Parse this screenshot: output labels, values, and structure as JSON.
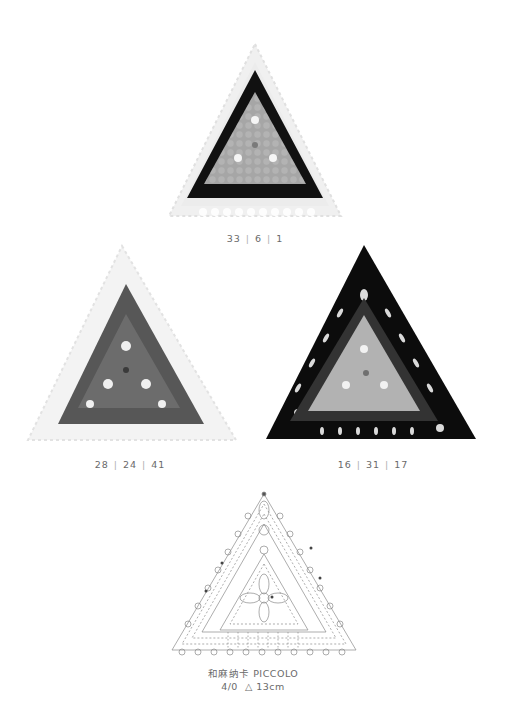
{
  "motifs": [
    {
      "id": "top",
      "caption_parts": [
        "33",
        "6",
        "1"
      ],
      "colors": {
        "outer": "#f2f2f2",
        "middle": "#111111",
        "inner": "#a8a8a8"
      }
    },
    {
      "id": "left",
      "caption_parts": [
        "28",
        "24",
        "41"
      ],
      "colors": {
        "outer": "#eeeeee",
        "middle": "#555555",
        "inner": "#6a6a6a"
      }
    },
    {
      "id": "right",
      "caption_parts": [
        "16",
        "31",
        "17"
      ],
      "colors": {
        "outer": "#0c0c0c",
        "middle": "#3a3a3a",
        "inner": "#b4b4b4"
      }
    }
  ],
  "diagram": {
    "yarn_line": "和麻纳卡 PICCOLO",
    "spec_line": "4/0  △ 13cm"
  },
  "separator": "|"
}
